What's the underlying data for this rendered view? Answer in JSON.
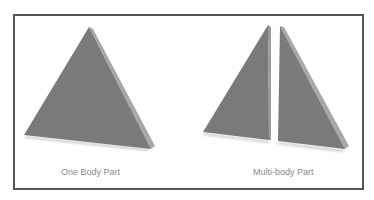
{
  "figure": {
    "left_panel": {
      "caption": "One Body Part"
    },
    "right_panel": {
      "caption": "Multi-body Part"
    },
    "colors": {
      "face": "#7a7a7a",
      "edge_face": "#a8a8a8",
      "border": "#555555",
      "caption": "#8a8a8a"
    }
  }
}
